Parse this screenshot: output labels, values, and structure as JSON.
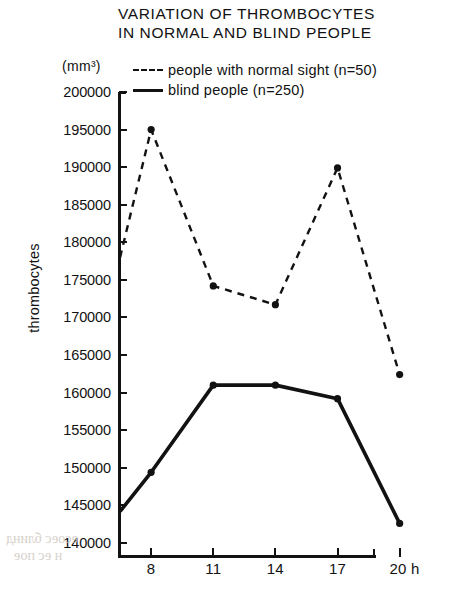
{
  "figure": {
    "title_lines": [
      "VARIATION OF THROMBOCYTES",
      "IN NORMAL AND BLIND PEOPLE"
    ],
    "unit_label": "(mm³)",
    "y_axis_title": "thrombocytes",
    "x_axis_unit_label": "20 h"
  },
  "legend": {
    "entries": [
      {
        "label": "people with normal sight (n=50)",
        "style": "dashed"
      },
      {
        "label": "blind people (n=250)",
        "style": "solid"
      }
    ]
  },
  "artifacts": {
    "bleed_1": "есоес блинд",
    "bleed_2": "н ес пое",
    "bleed_3": " "
  },
  "chart_data": {
    "type": "line",
    "title": "VARIATION OF THROMBOCYTES IN NORMAL AND BLIND PEOPLE",
    "xlabel": "h",
    "ylabel": "thrombocytes",
    "yunit": "mm³",
    "xlim": [
      6.4,
      20.5
    ],
    "ylim": [
      138000,
      200000
    ],
    "grid": false,
    "legend_position": "top",
    "x_ticks": [
      8,
      11,
      14,
      17,
      20
    ],
    "x_tick_labels": [
      "8",
      "11",
      "14",
      "17",
      "20 h"
    ],
    "y_ticks": [
      140000,
      145000,
      150000,
      155000,
      160000,
      165000,
      170000,
      175000,
      180000,
      185000,
      190000,
      195000,
      200000
    ],
    "y_tick_labels": [
      "140000",
      "145000",
      "150000",
      "155000",
      "160000",
      "165000",
      "170000",
      "175000",
      "180000",
      "185000",
      "190000",
      "195000",
      "200000"
    ],
    "series": [
      {
        "name": "people with normal sight (n=50)",
        "n": 50,
        "style": "dashed",
        "marker": "dot",
        "x": [
          6.5,
          8,
          11,
          14,
          17,
          20
        ],
        "values": [
          178000,
          195000,
          174200,
          171700,
          189900,
          162400
        ]
      },
      {
        "name": "blind people (n=250)",
        "n": 250,
        "style": "solid",
        "marker": "dot",
        "x": [
          6.5,
          8,
          11,
          14,
          17,
          20
        ],
        "values": [
          144200,
          149400,
          161000,
          161000,
          159200,
          142600
        ]
      }
    ]
  }
}
